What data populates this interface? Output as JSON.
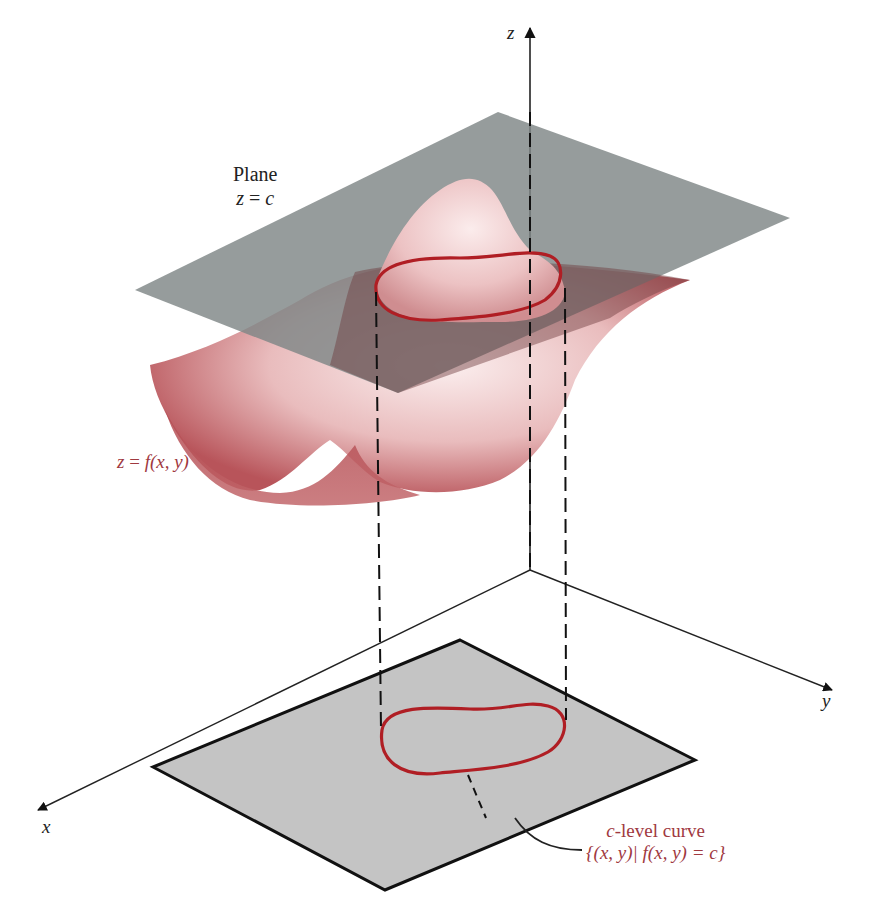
{
  "figure": {
    "type": "3D level-curve diagram",
    "axes": {
      "x_label": "x",
      "y_label": "y",
      "z_label": "z"
    },
    "plane_label": {
      "line1": "Plane",
      "line2_lhs": "z",
      "line2_eq": " = ",
      "line2_rhs": "c"
    },
    "surface_label": {
      "lhs": "z",
      "eq": " = ",
      "rhs": "f(x, y)"
    },
    "level_curve_label": {
      "line1_var": "c",
      "line1_text": "-level curve",
      "line2": "{(x, y)| f(x, y) = c}"
    },
    "colors": {
      "plane": "#8e9494",
      "surface_light": "#f4dfdf",
      "surface_dark": "#b8545a",
      "contour": "#b01e24",
      "floor_region": "#c4c4c4",
      "label_red": "#a0393f",
      "axis": "#222222"
    }
  }
}
